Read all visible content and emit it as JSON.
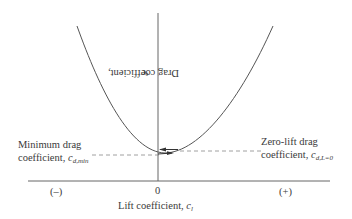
{
  "diagram": {
    "type": "drag polar",
    "y_axis_label": "Drag coefficient, ",
    "y_axis_symbol": "c",
    "y_axis_subscript": "d",
    "x_axis_label": "Lift coefficient, ",
    "x_axis_symbol": "c",
    "x_axis_subscript": "l",
    "x_origin_label": "0",
    "x_negative_label": "(–)",
    "x_positive_label": "(+)",
    "min_drag": {
      "line1": "Minimum drag",
      "line2": "coefficient, ",
      "symbol": "c",
      "subscript": "d,min"
    },
    "zero_lift_drag": {
      "line1": "Zero-lift drag",
      "line2": "coefficient, ",
      "symbol": "c",
      "subscript": "d,L=0"
    },
    "colors": {
      "line": "#555555",
      "dashed": "#888888",
      "text": "#3a3a3a"
    }
  }
}
